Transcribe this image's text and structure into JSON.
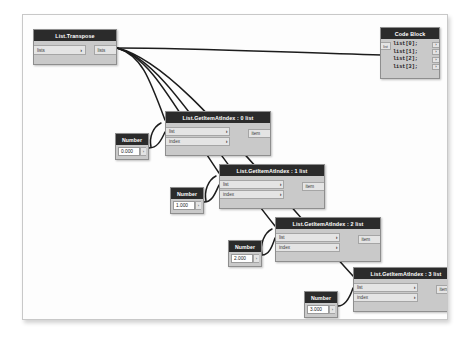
{
  "canvas": {
    "background": "#fdfdfd",
    "border_color": "#c8c8c8",
    "node_body_color": "#c9c9c9",
    "node_header_color": "#2b2b2b",
    "port_color": "#e4e4e4",
    "wire_color": "#1c1c1c"
  },
  "nodes": {
    "transpose": {
      "title": "List.Transpose",
      "input_label": "lists",
      "output_label": "lists",
      "chevron": "›"
    },
    "code_block": {
      "title": "Code Block",
      "input_label": "list",
      "lines": [
        "list[0];",
        "list[1];",
        "list[2];",
        "list[3];"
      ],
      "port_glyph": "›"
    },
    "get_item_0": {
      "title": "List.GetItemAtIndex : 0 list",
      "input_list": "list",
      "input_index": "index",
      "output_item": "item",
      "chevron": "›"
    },
    "get_item_1": {
      "title": "List.GetItemAtIndex : 1 list",
      "input_list": "list",
      "input_index": "index",
      "output_item": "item",
      "chevron": "›"
    },
    "get_item_2": {
      "title": "List.GetItemAtIndex : 2 list",
      "input_list": "list",
      "input_index": "index",
      "output_item": "item",
      "chevron": "›"
    },
    "get_item_3": {
      "title": "List.GetItemAtIndex : 3 list",
      "input_list": "list",
      "input_index": "index",
      "output_item": "item",
      "chevron": "›"
    },
    "number_0": {
      "title": "Number",
      "value": "0.000",
      "port_glyph": "›"
    },
    "number_1": {
      "title": "Number",
      "value": "1.000",
      "port_glyph": "›"
    },
    "number_2": {
      "title": "Number",
      "value": "2.000",
      "port_glyph": "›"
    },
    "number_3": {
      "title": "Number",
      "value": "3.000",
      "port_glyph": "›"
    }
  }
}
